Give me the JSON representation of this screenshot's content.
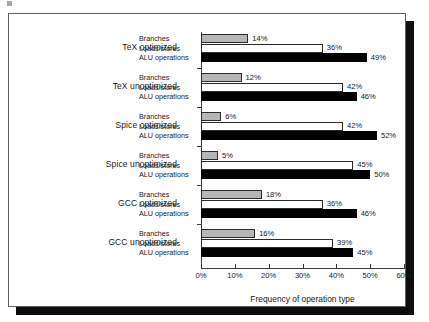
{
  "chart_data": {
    "type": "bar",
    "orientation": "horizontal",
    "title": "",
    "xlabel": "Frequency of operation type",
    "ylabel": "",
    "xlim": [
      0,
      60
    ],
    "xtick_labels": [
      "0%",
      "10%",
      "20%",
      "30%",
      "40%",
      "50%",
      "60%"
    ],
    "xticks": [
      0,
      10,
      20,
      30,
      40,
      50,
      60
    ],
    "grid": false,
    "legend_position": "inline-row-labels",
    "value_suffix": "%",
    "categories": [
      "TeX optimized",
      "TeX unoptimized",
      "Spice optimized",
      "Spice unoptimized",
      "GCC optimized",
      "GCC unoptimized"
    ],
    "series": [
      {
        "name": "Branches",
        "color": "#b6b6b6",
        "values": [
          14,
          12,
          6,
          5,
          18,
          16
        ]
      },
      {
        "name": "Loads/stores",
        "color": "#ffffff",
        "values": [
          36,
          42,
          42,
          45,
          36,
          39
        ]
      },
      {
        "name": "ALU operations",
        "color": "#000000",
        "values": [
          49,
          46,
          52,
          50,
          46,
          45
        ]
      }
    ],
    "value_labels": [
      [
        "14%",
        "36%",
        "49%"
      ],
      [
        "12%",
        "42%",
        "46%"
      ],
      [
        "6%",
        "42%",
        "52%"
      ],
      [
        "5%",
        "45%",
        "50%"
      ],
      [
        "18%",
        "36%",
        "46%"
      ],
      [
        "16%",
        "39%",
        "45%"
      ]
    ]
  }
}
